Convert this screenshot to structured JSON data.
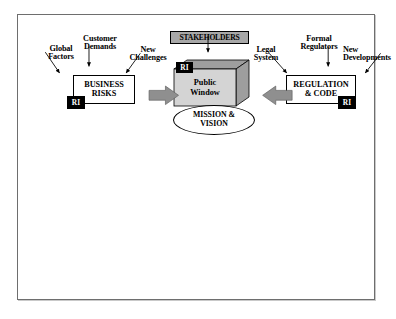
{
  "diagram": {
    "title_visible": false,
    "inputs_left": [
      {
        "id": "global-factors",
        "label": "Global\nFactors"
      },
      {
        "id": "customer-demands",
        "label": "Customer\nDemands"
      },
      {
        "id": "new-challenges",
        "label": "New\nChallenges"
      }
    ],
    "inputs_right": [
      {
        "id": "legal-system",
        "label": "Legal\nSystem"
      },
      {
        "id": "formal-regulators",
        "label": "Formal\nRegulators"
      },
      {
        "id": "new-developments",
        "label": "New\nDevelopments"
      }
    ],
    "nodes": {
      "business_risks": {
        "label": "BUSINESS\nRISKS",
        "badge": "RI"
      },
      "regulation_code": {
        "label": "REGULATION\n& CODE",
        "badge": "RI"
      },
      "stakeholders": {
        "label": "STAKEHOLDERS"
      },
      "public_window": {
        "label": "Public\nWindow",
        "badge": "RI"
      },
      "mission_vision": {
        "label": "MISSION &\nVISION"
      }
    },
    "labels": {
      "global_factors_line1": "Global",
      "global_factors_line2": "Factors",
      "customer_demands_line1": "Customer",
      "customer_demands_line2": "Demands",
      "new_challenges_line1": "New",
      "new_challenges_line2": "Challenges",
      "legal_system_line1": "Legal",
      "legal_system_line2": "System",
      "formal_regulators_line1": "Formal",
      "formal_regulators_line2": "Regulators",
      "new_developments_line1": "New",
      "new_developments_line2": "Developments",
      "business_risks_line1": "BUSINESS",
      "business_risks_line2": "RISKS",
      "regulation_line1": "REGULATION",
      "regulation_line2": "& CODE",
      "stakeholders": "STAKEHOLDERS",
      "public_window_line1": "Public",
      "public_window_line2": "Window",
      "mission_line1": "MISSION &",
      "mission_line2": "VISION",
      "badge_ri": "RI"
    },
    "colors": {
      "frame_border": "#6e6e6e",
      "stakeholders_fill": "#a8a8a8",
      "cuboid_front": "#d4d4d4",
      "cuboid_shade": "#9e9e9e",
      "block_arrow": "#8f8f8f",
      "badge_fill": "#000000",
      "badge_text": "#ffffff",
      "stroke": "#000000",
      "page_bg": "#ffffff"
    }
  }
}
